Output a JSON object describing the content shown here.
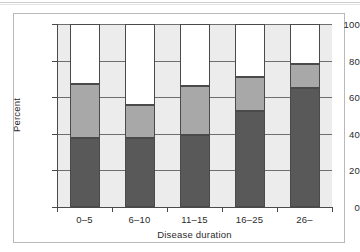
{
  "chart_data": {
    "type": "bar",
    "subtype": "stacked-percent",
    "title": "",
    "xlabel": "Disease duration",
    "ylabel": "Percent",
    "categories": [
      "0–5",
      "6–10",
      "11–15",
      "16–25",
      "26–"
    ],
    "ylim": [
      0,
      100
    ],
    "yticks": [
      0,
      20,
      40,
      60,
      80,
      100
    ],
    "ytick_labels": [
      "0",
      "20",
      "40",
      "60",
      "80",
      "100"
    ],
    "grid": true,
    "legend": "none",
    "series": [
      {
        "name": "dark",
        "color": "#595959",
        "values": [
          37.5,
          37.5,
          39.5,
          52.5,
          65.0
        ]
      },
      {
        "name": "medium-gray",
        "color": "#a8a8a8",
        "values": [
          29.5,
          18.0,
          26.5,
          18.5,
          13.0
        ]
      },
      {
        "name": "white",
        "color": "#ffffff",
        "values": [
          33.0,
          44.5,
          34.0,
          29.0,
          22.0
        ]
      }
    ],
    "cumulative_tops": [
      {
        "dark": 37.5,
        "gray": 67.0,
        "white": 100.0
      },
      {
        "dark": 37.5,
        "gray": 55.5,
        "white": 100.0
      },
      {
        "dark": 39.5,
        "gray": 66.0,
        "white": 100.0
      },
      {
        "dark": 52.5,
        "gray": 71.0,
        "white": 100.0
      },
      {
        "dark": 65.0,
        "gray": 78.0,
        "white": 100.0
      }
    ],
    "colors": {
      "plot_background": "#ececec",
      "figure_background": "#ffffff",
      "axis": "#4a4a4a",
      "gridline": "#6e6e6e",
      "frame": "#b9b9b9"
    }
  }
}
